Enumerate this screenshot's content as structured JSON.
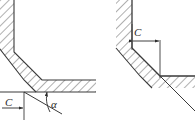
{
  "figure": {
    "type": "engineering-drawing",
    "background_color": "#ffffff",
    "line_color": "#3a3a3a",
    "hatch_color": "#6e6e6e",
    "hatch_angle_deg": 45,
    "views": [
      {
        "name": "left-view",
        "labels": {
          "chamfer_width": "C",
          "chamfer_angle": "α"
        }
      },
      {
        "name": "right-view",
        "labels": {
          "chamfer_width": "C"
        }
      }
    ]
  },
  "labels": {
    "c_left": "C",
    "alpha_left": "α",
    "c_right": "C"
  }
}
